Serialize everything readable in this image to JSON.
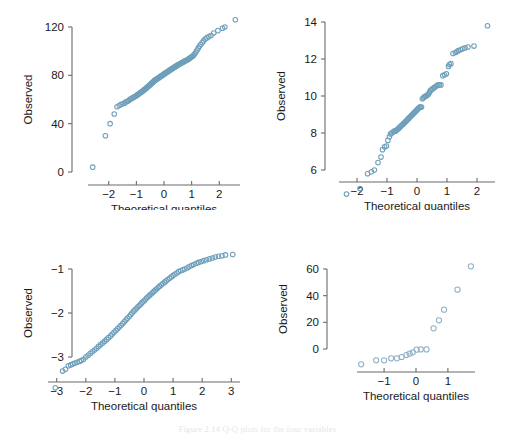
{
  "figure": {
    "caption": "Figure 2.14  Q-Q plots for the four variables",
    "marker_color": "#6f9fba",
    "axis_color": "#6b6b6b",
    "text_color": "#1a1a1a",
    "background": "#ffffff"
  },
  "chart_data": [
    {
      "id": "panel-top-left",
      "type": "scatter",
      "title": "",
      "xlabel": "Theoretical quantiles",
      "ylabel": "Observed",
      "xticks": [
        -2,
        -1,
        0,
        1,
        2
      ],
      "xticklabels": [
        "−2",
        "−1",
        "0",
        "1",
        "2"
      ],
      "yticks": [
        0,
        40,
        80,
        120
      ],
      "yticklabels": [
        "0",
        "40",
        "80",
        "120"
      ],
      "xlim": [
        -2.75,
        2.75
      ],
      "ylim": [
        -5,
        132
      ],
      "grid": false,
      "legend": "none",
      "marker": "open-circle",
      "x": [
        -2.58,
        -2.12,
        -1.95,
        -1.8,
        -1.7,
        -1.62,
        -1.55,
        -1.49,
        -1.43,
        -1.38,
        -1.33,
        -1.28,
        -1.24,
        -1.2,
        -1.16,
        -1.12,
        -1.08,
        -1.05,
        -1.01,
        -0.98,
        -0.95,
        -0.92,
        -0.89,
        -0.86,
        -0.83,
        -0.8,
        -0.77,
        -0.74,
        -0.72,
        -0.69,
        -0.66,
        -0.64,
        -0.61,
        -0.59,
        -0.56,
        -0.54,
        -0.51,
        -0.49,
        -0.46,
        -0.44,
        -0.42,
        -0.39,
        -0.37,
        -0.35,
        -0.33,
        -0.3,
        -0.28,
        -0.26,
        -0.24,
        -0.21,
        -0.19,
        -0.17,
        -0.15,
        -0.13,
        -0.11,
        -0.08,
        -0.06,
        -0.04,
        -0.02,
        0.0,
        0.02,
        0.04,
        0.06,
        0.08,
        0.11,
        0.13,
        0.15,
        0.17,
        0.19,
        0.21,
        0.24,
        0.26,
        0.28,
        0.3,
        0.33,
        0.35,
        0.37,
        0.39,
        0.42,
        0.44,
        0.46,
        0.49,
        0.51,
        0.54,
        0.56,
        0.59,
        0.61,
        0.64,
        0.66,
        0.69,
        0.72,
        0.74,
        0.77,
        0.8,
        0.83,
        0.86,
        0.89,
        0.92,
        0.95,
        0.98,
        1.01,
        1.05,
        1.08,
        1.12,
        1.16,
        1.2,
        1.24,
        1.28,
        1.33,
        1.38,
        1.43,
        1.49,
        1.55,
        1.62,
        1.7,
        1.8,
        1.95,
        2.12,
        2.2,
        2.58
      ],
      "y": [
        4,
        30,
        40,
        48,
        54,
        55,
        56,
        56.5,
        57,
        58,
        58.5,
        59,
        60,
        60.5,
        61,
        61.5,
        62,
        62.5,
        63,
        63.5,
        64,
        64.5,
        65,
        65.5,
        66,
        66.5,
        67,
        67.5,
        68,
        68.5,
        69,
        69.5,
        70,
        70.5,
        71,
        71.5,
        72,
        72.5,
        73,
        73.5,
        74,
        74.5,
        75,
        75.5,
        76,
        76.2,
        76.5,
        77,
        77.3,
        77.6,
        78,
        78.3,
        78.6,
        79,
        79.3,
        79.6,
        80,
        80.3,
        80.6,
        81,
        81.3,
        81.6,
        82,
        82.3,
        82.6,
        83,
        83.3,
        83.6,
        84,
        84.3,
        84.6,
        85,
        85.3,
        85.6,
        86,
        86.3,
        86.6,
        87,
        87.3,
        87.6,
        88,
        88.3,
        88.6,
        89,
        89.3,
        89.6,
        90,
        90.3,
        90.6,
        91,
        91.3,
        91.6,
        92,
        92.3,
        92.6,
        93,
        93.5,
        94,
        94.5,
        95,
        95.5,
        96,
        97,
        98,
        99.5,
        101,
        102.5,
        104,
        105.5,
        107,
        108.5,
        110,
        111,
        112,
        113,
        115,
        117,
        119,
        120,
        126
      ]
    },
    {
      "id": "panel-top-right",
      "type": "scatter",
      "title": "",
      "xlabel": "Theoretical quantiles",
      "ylabel": "Observed",
      "xticks": [
        -2,
        -1,
        0,
        1,
        2
      ],
      "xticklabels": [
        "−2",
        "−1",
        "0",
        "1",
        "2"
      ],
      "yticks": [
        6,
        8,
        10,
        12,
        14
      ],
      "yticklabels": [
        "6",
        "8",
        "10",
        "12",
        "14"
      ],
      "xlim": [
        -2.6,
        2.6
      ],
      "ylim": [
        4.3,
        14.3
      ],
      "grid": false,
      "legend": "none",
      "marker": "open-circle",
      "x": [
        -2.35,
        -1.9,
        -1.65,
        -1.52,
        -1.42,
        -1.3,
        -1.2,
        -1.15,
        -1.08,
        -1.02,
        -0.97,
        -0.92,
        -0.88,
        -0.84,
        -0.8,
        -0.76,
        -0.72,
        -0.68,
        -0.65,
        -0.61,
        -0.58,
        -0.55,
        -0.52,
        -0.48,
        -0.45,
        -0.42,
        -0.39,
        -0.36,
        -0.33,
        -0.3,
        -0.27,
        -0.24,
        -0.21,
        -0.18,
        -0.15,
        -0.12,
        -0.09,
        -0.06,
        -0.03,
        0.0,
        0.03,
        0.06,
        0.09,
        0.12,
        0.15,
        0.18,
        0.21,
        0.25,
        0.28,
        0.31,
        0.35,
        0.38,
        0.42,
        0.45,
        0.49,
        0.53,
        0.57,
        0.61,
        0.66,
        0.7,
        0.75,
        0.8,
        0.86,
        0.92,
        0.98,
        1.05,
        1.08,
        1.13,
        1.2,
        1.28,
        1.33,
        1.38,
        1.45,
        1.52,
        1.6,
        1.7,
        1.9,
        2.35
      ],
      "y": [
        4.7,
        5.0,
        5.8,
        5.9,
        6.0,
        6.4,
        6.7,
        7.1,
        7.25,
        7.3,
        7.6,
        7.8,
        7.95,
        8.0,
        8.05,
        8.1,
        8.1,
        8.15,
        8.2,
        8.25,
        8.3,
        8.35,
        8.4,
        8.45,
        8.5,
        8.55,
        8.6,
        8.65,
        8.7,
        8.75,
        8.8,
        8.85,
        8.9,
        8.95,
        9.0,
        9.05,
        9.1,
        9.15,
        9.2,
        9.25,
        9.3,
        9.35,
        9.4,
        9.4,
        9.4,
        9.85,
        9.9,
        9.95,
        10.0,
        10.0,
        10.05,
        10.1,
        10.2,
        10.3,
        10.35,
        10.4,
        10.45,
        10.5,
        10.55,
        10.6,
        10.6,
        10.6,
        11.1,
        11.15,
        11.2,
        11.6,
        11.7,
        11.75,
        12.3,
        12.35,
        12.4,
        12.45,
        12.5,
        12.55,
        12.6,
        12.65,
        12.7,
        13.8
      ]
    },
    {
      "id": "panel-bottom-left",
      "type": "scatter",
      "title": "",
      "xlabel": "Theoretical quantiles",
      "ylabel": "Observed",
      "xticks": [
        -3,
        -2,
        -1,
        0,
        1,
        2,
        3
      ],
      "xticklabels": [
        "−3",
        "−2",
        "−1",
        "0",
        "1",
        "2",
        "3"
      ],
      "yticks": [
        -1,
        -2,
        -3
      ],
      "yticklabels": [
        "−1",
        "−2",
        "−3"
      ],
      "xlim": [
        -3.3,
        3.3
      ],
      "ylim": [
        -3.75,
        -0.55
      ],
      "grid": false,
      "legend": "none",
      "marker": "open-circle",
      "x": [
        -3.05,
        -2.8,
        -2.7,
        -2.6,
        -2.52,
        -2.45,
        -2.38,
        -2.3,
        -2.22,
        -2.15,
        -2.08,
        -2.0,
        -1.92,
        -1.85,
        -1.78,
        -1.7,
        -1.63,
        -1.56,
        -1.49,
        -1.42,
        -1.35,
        -1.28,
        -1.22,
        -1.15,
        -1.09,
        -1.03,
        -0.97,
        -0.91,
        -0.85,
        -0.79,
        -0.73,
        -0.68,
        -0.62,
        -0.57,
        -0.51,
        -0.46,
        -0.41,
        -0.36,
        -0.31,
        -0.26,
        -0.21,
        -0.16,
        -0.11,
        -0.06,
        -0.01,
        0.04,
        0.09,
        0.14,
        0.19,
        0.24,
        0.29,
        0.34,
        0.39,
        0.44,
        0.49,
        0.54,
        0.6,
        0.65,
        0.71,
        0.76,
        0.82,
        0.88,
        0.94,
        1.0,
        1.06,
        1.13,
        1.19,
        1.26,
        1.33,
        1.4,
        1.48,
        1.55,
        1.63,
        1.71,
        1.8,
        1.88,
        1.97,
        2.06,
        2.15,
        2.25,
        2.35,
        2.45,
        2.56,
        2.68,
        2.8,
        3.05
      ],
      "y": [
        -3.7,
        -3.32,
        -3.28,
        -3.2,
        -3.18,
        -3.16,
        -3.14,
        -3.12,
        -3.1,
        -3.08,
        -3.05,
        -3.0,
        -2.96,
        -2.92,
        -2.88,
        -2.84,
        -2.8,
        -2.76,
        -2.72,
        -2.68,
        -2.64,
        -2.6,
        -2.56,
        -2.52,
        -2.48,
        -2.44,
        -2.4,
        -2.36,
        -2.32,
        -2.28,
        -2.24,
        -2.2,
        -2.16,
        -2.12,
        -2.08,
        -2.04,
        -2.0,
        -1.96,
        -1.93,
        -1.9,
        -1.86,
        -1.83,
        -1.8,
        -1.76,
        -1.73,
        -1.7,
        -1.66,
        -1.63,
        -1.6,
        -1.57,
        -1.54,
        -1.51,
        -1.48,
        -1.45,
        -1.42,
        -1.39,
        -1.36,
        -1.33,
        -1.3,
        -1.27,
        -1.24,
        -1.21,
        -1.18,
        -1.15,
        -1.12,
        -1.09,
        -1.06,
        -1.04,
        -1.02,
        -1.0,
        -0.98,
        -0.95,
        -0.92,
        -0.9,
        -0.87,
        -0.85,
        -0.83,
        -0.81,
        -0.79,
        -0.77,
        -0.75,
        -0.73,
        -0.71,
        -0.7,
        -0.68,
        -0.67
      ]
    },
    {
      "id": "panel-bottom-right",
      "type": "scatter",
      "title": "",
      "xlabel": "Theoretical quantiles",
      "ylabel": "Observed",
      "xticks": [
        -1,
        0,
        1
      ],
      "xticklabels": [
        "−1",
        "0",
        "1"
      ],
      "yticks": [
        0,
        20,
        40,
        60
      ],
      "yticklabels": [
        "0",
        "20",
        "40",
        "60"
      ],
      "xlim": [
        -1.85,
        1.85
      ],
      "ylim": [
        -13,
        66
      ],
      "grid": false,
      "legend": "none",
      "marker": "open-circle",
      "x": [
        -1.72,
        -1.25,
        -1.0,
        -0.78,
        -0.6,
        -0.45,
        -0.3,
        -0.2,
        -0.1,
        0.02,
        0.15,
        0.33,
        0.55,
        0.72,
        0.88,
        1.3,
        1.72
      ],
      "y": [
        -11.5,
        -8.5,
        -8.5,
        -7.0,
        -7.0,
        -6.0,
        -4.5,
        -3.5,
        -2.5,
        -0.5,
        -0.3,
        -0.3,
        15.5,
        21.5,
        29.5,
        44.5,
        62.0
      ]
    }
  ]
}
